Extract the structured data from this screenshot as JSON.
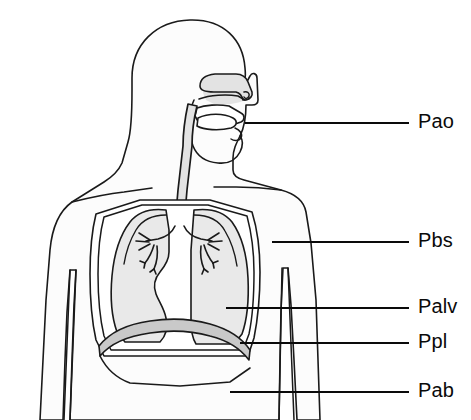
{
  "figure": {
    "background_color": "#ffffff",
    "outline_color": "#1a1a1a",
    "airway_fill_color": "#e3e3e3",
    "lung_fill_color": "#e9e9e9",
    "pleural_fill_color": "#ffffff",
    "diaphragm_fill_color": "#c9c9c9",
    "body_fill_color": "#fcfcfc"
  },
  "labels": [
    {
      "id": "pao",
      "text": "Pao",
      "meaning": "pressure at airway opening",
      "text_x": 418,
      "text_y": 123,
      "leader_x1": 245,
      "leader_y1": 123,
      "leader_x2": 409,
      "leader_y2": 123
    },
    {
      "id": "pbs",
      "text": "Pbs",
      "meaning": "pressure at body surface",
      "text_x": 418,
      "text_y": 242,
      "leader_x1": 272,
      "leader_y1": 242,
      "leader_x2": 409,
      "leader_y2": 242
    },
    {
      "id": "palv",
      "text": "Palv",
      "meaning": "alveolar pressure",
      "text_x": 418,
      "text_y": 308,
      "leader_x1": 226,
      "leader_y1": 308,
      "leader_x2": 409,
      "leader_y2": 308
    },
    {
      "id": "ppl",
      "text": "Ppl",
      "meaning": "pleural pressure",
      "text_x": 418,
      "text_y": 343,
      "leader_x1": 240,
      "leader_y1": 343,
      "leader_x2": 409,
      "leader_y2": 343
    },
    {
      "id": "pab",
      "text": "Pab",
      "meaning": "abdominal pressure",
      "text_x": 418,
      "text_y": 392,
      "leader_x1": 230,
      "leader_y1": 392,
      "leader_x2": 409,
      "leader_y2": 392
    }
  ],
  "anatomy_parts": [
    "head-profile",
    "neck",
    "nasal-cavity",
    "oral-cavity",
    "tongue",
    "pharynx",
    "trachea",
    "left-lung",
    "right-lung",
    "bronchial-tree",
    "pleural-space",
    "chest-wall",
    "diaphragm",
    "left-arm",
    "right-arm",
    "abdomen"
  ]
}
